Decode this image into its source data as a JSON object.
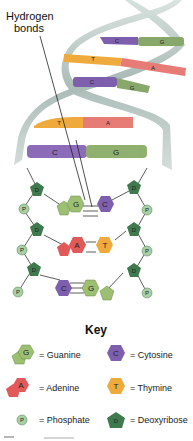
{
  "diagram": {
    "callout": {
      "line1": "Hydrogen",
      "line2": "bonds"
    },
    "helix_rungs": [
      {
        "left": "C",
        "right": "G"
      },
      {
        "left": "T",
        "right": "A"
      },
      {
        "left": "C",
        "right": "G"
      },
      {
        "left": "T",
        "right": "A"
      },
      {
        "left": "C",
        "right": "G"
      }
    ],
    "ladder_pairs": [
      {
        "left": "G",
        "right": "C"
      },
      {
        "left": "A",
        "right": "T"
      },
      {
        "left": "C",
        "right": "G"
      }
    ],
    "sugar_label": "D",
    "phosphate_label": "P"
  },
  "key": {
    "title": "Key",
    "items": [
      {
        "symbol": "G",
        "label": "= Guanine"
      },
      {
        "symbol": "C",
        "label": "= Cytosine"
      },
      {
        "symbol": "A",
        "label": "= Adenine"
      },
      {
        "symbol": "T",
        "label": "= Thymine"
      },
      {
        "symbol": "P",
        "label": "= Phosphate"
      },
      {
        "symbol": "D",
        "label": "= Deoxyribose"
      }
    ]
  },
  "colors": {
    "guanine": "#9cbf72",
    "cytosine": "#7d5fae",
    "adenine": "#e2595a",
    "thymine": "#eeaa3c",
    "phosphate": "#a9d0a4",
    "deoxyribose": "#3f7a4e",
    "backbone": "#b9c8c4"
  }
}
